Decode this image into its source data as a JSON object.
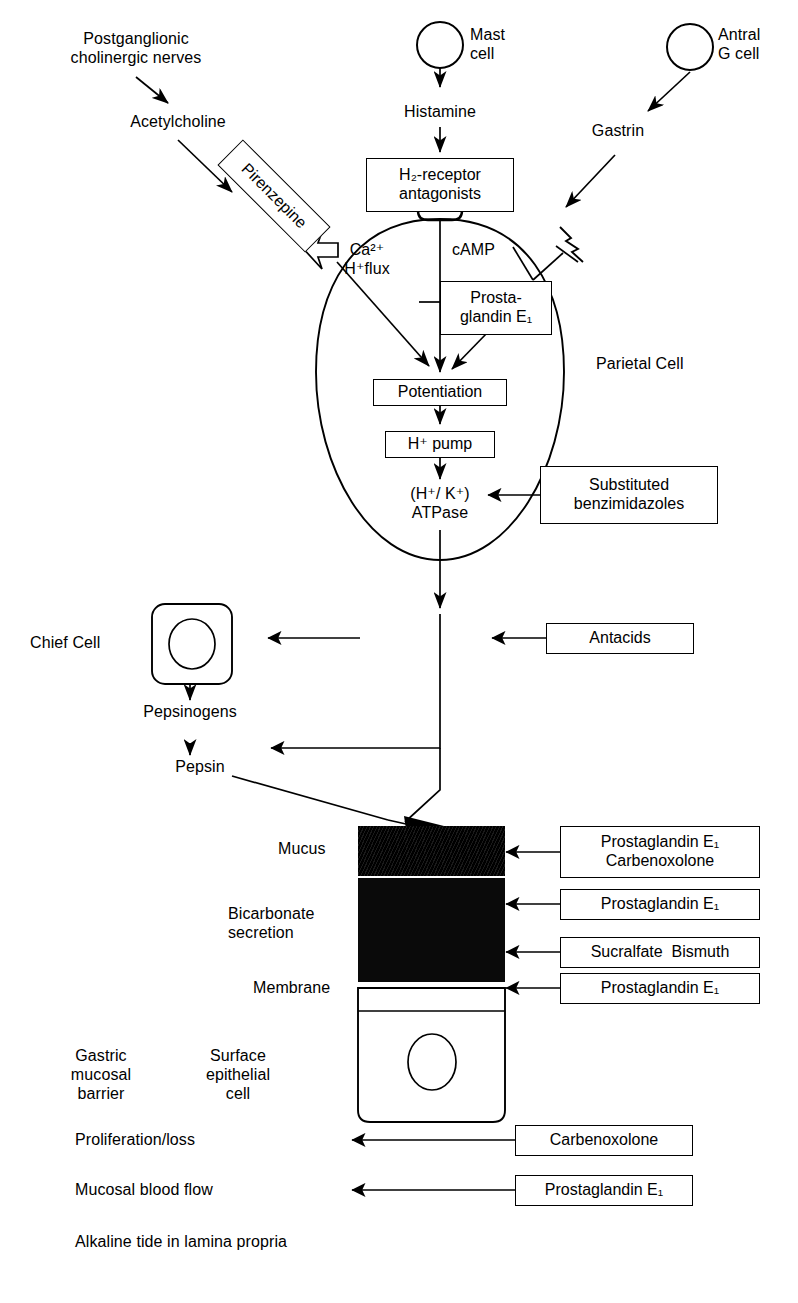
{
  "diagram": {
    "ink_color": "#000000",
    "background_color": "#ffffff"
  },
  "sources": {
    "nerves": "Postganglionic\ncholinergic nerves",
    "acetylcholine": "Acetylcholine",
    "mast_cell": "Mast\ncell",
    "histamine": "Histamine",
    "antral_g_cell": "Antral\nG cell",
    "gastrin": "Gastrin"
  },
  "drug_boxes": {
    "pirenzepine": "Pirenzepine",
    "h2_antagonists": "H₂-receptor\nantagonists",
    "prostaglandin_e1_cell": "Prosta-\nglandin E₁",
    "substituted_benzimidazoles": "Substituted\nbenzimidazoles",
    "antacids": "Antacids",
    "mucus_drugs": "Prostaglandin E₁\nCarbenoxolone",
    "bicarb_drug_top": "Prostaglandin E₁",
    "bicarb_drug_bottom": "Sucralfate  Bismuth",
    "membrane_drug": "Prostaglandin E₁",
    "proliferation_drug": "Carbenoxolone",
    "blood_flow_drug": "Prostaglandin E₁"
  },
  "parietal_cell": {
    "name": "Parietal Cell",
    "ca_flux": "Ca²⁺\nH⁺flux",
    "camp": "cAMP",
    "potentiation": "Potentiation",
    "h_pump": "H⁺ pump",
    "atpase": "(H⁺/ K⁺)\nATPase"
  },
  "chief_cell": {
    "name": "Chief Cell",
    "pepsinogens": "Pepsinogens",
    "pepsin": "Pepsin"
  },
  "mucosal_barrier": {
    "mucus": "Mucus",
    "bicarbonate": "Bicarbonate\nsecretion",
    "membrane": "Membrane",
    "barrier_label": "Gastric\nmucosal\nbarrier",
    "cell_label": "Surface\nepithelial\ncell",
    "proliferation": "Proliferation/loss",
    "blood_flow": "Mucosal blood flow",
    "alkaline_tide": "Alkaline tide in lamina propria"
  }
}
